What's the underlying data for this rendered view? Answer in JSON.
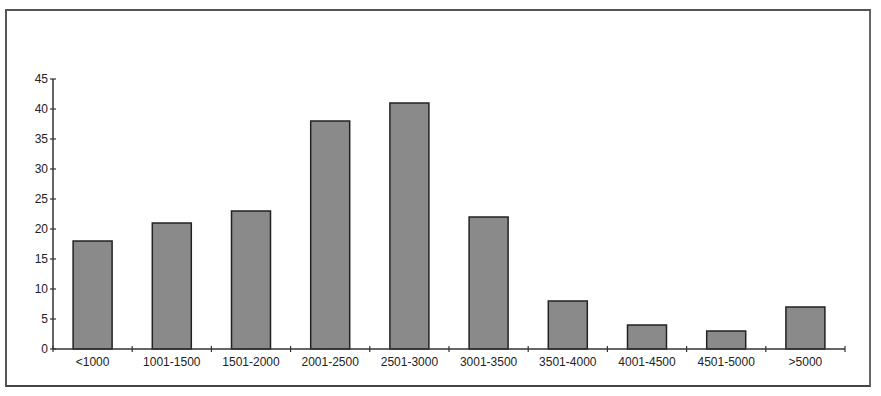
{
  "chart_data": {
    "type": "bar",
    "title": "",
    "xlabel": "",
    "ylabel": "",
    "categories": [
      "<1000",
      "1001-1500",
      "1501-2000",
      "2001-2500",
      "2501-3000",
      "3001-3500",
      "3501-4000",
      "4001-4500",
      "4501-5000",
      ">5000"
    ],
    "values": [
      18,
      21,
      23,
      38,
      41,
      22,
      8,
      4,
      3,
      7
    ],
    "ylim": [
      0,
      45
    ],
    "yticks": [
      0,
      5,
      10,
      15,
      20,
      25,
      30,
      35,
      40,
      45
    ],
    "grid": false,
    "legend": null,
    "bar_color": "#8a8a8a",
    "bar_edge_color": "#222222"
  }
}
